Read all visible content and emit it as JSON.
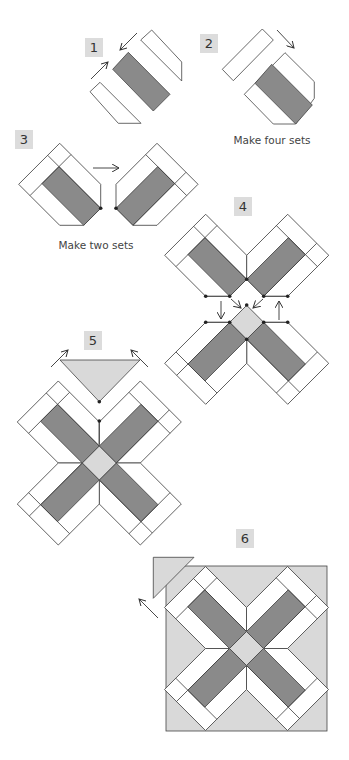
{
  "colors": {
    "dark_fabric": "#8a8a8a",
    "light_fabric": "#d9d9d9",
    "white_fabric": "#ffffff",
    "outline": "#444444",
    "label_bg": "#dcdcdc"
  },
  "steps": [
    {
      "number": "1",
      "label_pos": [
        85,
        38
      ]
    },
    {
      "number": "2",
      "label_pos": [
        200,
        34
      ]
    },
    {
      "number": "3",
      "label_pos": [
        15,
        130
      ]
    },
    {
      "number": "4",
      "label_pos": [
        234,
        197
      ]
    },
    {
      "number": "5",
      "label_pos": [
        84,
        331
      ]
    },
    {
      "number": "6",
      "label_pos": [
        236,
        529
      ]
    }
  ],
  "captions": [
    {
      "text": "Make four sets",
      "pos": [
        272,
        135
      ]
    },
    {
      "text": "Make two sets",
      "pos": [
        96,
        240
      ]
    }
  ],
  "geometry": {
    "arm": {
      "bar_half": 12,
      "side": 29,
      "bar_end": 71,
      "tip": 87
    },
    "step1": {
      "bar": [
        [
          112.7,
          69.3
        ],
        [
          128.3,
          52.3
        ],
        [
          170,
          94.3
        ],
        [
          153.3,
          111
        ]
      ],
      "strip_upper": [
        [
          140.7,
          40
        ],
        [
          151.7,
          30
        ],
        [
          181.7,
          62
        ],
        [
          181.7,
          81
        ]
      ],
      "strip_lower": [
        [
          90,
          91.7
        ],
        [
          100,
          82.3
        ],
        [
          141,
          123.3
        ],
        [
          118.3,
          123.3
        ]
      ],
      "arrows": [
        [
          [
            91,
            79
          ],
          [
            108,
            62
          ]
        ],
        [
          [
            137,
            33
          ],
          [
            120,
            50
          ]
        ]
      ]
    },
    "step2": {
      "strip": [
        [
          222.3,
          69.3
        ],
        [
          262.3,
          29
        ],
        [
          273.3,
          40
        ],
        [
          233.3,
          80.7
        ]
      ],
      "outline": [
        [
          285,
          52.7
        ],
        [
          314.3,
          81.7
        ],
        [
          314.3,
          98.3
        ],
        [
          295.7,
          124
        ],
        [
          273.3,
          124
        ],
        [
          244.3,
          94.3
        ],
        [
          255,
          83.3
        ]
      ],
      "bar": [
        [
          255,
          83.3
        ],
        [
          271.7,
          64.3
        ],
        [
          312.3,
          105
        ],
        [
          295.7,
          124
        ]
      ],
      "inner_line": [
        [
          255,
          83.3
        ],
        [
          273.3,
          124
        ]
      ],
      "arrows": [
        [
          [
            277,
            30
          ],
          [
            294,
            48
          ]
        ]
      ]
    },
    "step3": {
      "units": [
        {
          "center": [
            100.7,
            225.3
          ],
          "rot": 0
        },
        {
          "center": [
            116,
            225.3
          ],
          "rot": 90
        }
      ],
      "dots": [
        [
          100.7,
          208.3
        ],
        [
          116,
          208.3
        ]
      ],
      "arrows": [
        [
          [
            93,
            168
          ],
          [
            119,
            168
          ]
        ]
      ]
    },
    "step4": {
      "upper": {
        "center": [
          246.7,
          296.3
        ],
        "rots": [
          0,
          90
        ]
      },
      "lower": {
        "center": [
          246.7,
          322.3
        ],
        "rots": [
          180,
          270
        ],
        "square": true
      },
      "dots": [
        [
          205.7,
          296.3
        ],
        [
          229.7,
          296.3
        ],
        [
          246.7,
          279.3
        ],
        [
          263.7,
          296.3
        ],
        [
          287.7,
          296.3
        ],
        [
          246.7,
          305
        ],
        [
          205.7,
          322.3
        ],
        [
          229.7,
          322.3
        ],
        [
          263.7,
          322.3
        ],
        [
          287.7,
          322.3
        ],
        [
          246.7,
          339.3
        ]
      ],
      "lines": [
        [
          [
            205.7,
            296.3
          ],
          [
            229.7,
            296.3
          ]
        ],
        [
          [
            263.7,
            296.3
          ],
          [
            287.7,
            296.3
          ]
        ],
        [
          [
            205.7,
            322.3
          ],
          [
            229.7,
            322.3
          ]
        ],
        [
          [
            263.7,
            322.3
          ],
          [
            287.7,
            322.3
          ]
        ]
      ],
      "arrows": [
        [
          [
            221,
            301
          ],
          [
            221,
            319
          ]
        ],
        [
          [
            279,
            320
          ],
          [
            279,
            301
          ]
        ],
        [
          [
            231,
            299
          ],
          [
            241,
            308
          ]
        ],
        [
          [
            263,
            299
          ],
          [
            253,
            308
          ]
        ]
      ]
    },
    "step5": {
      "cross": {
        "center": [
          99.3,
          463
        ],
        "rots": [
          0,
          90,
          180,
          270
        ],
        "square": true
      },
      "triangle": [
        [
          60,
          360
        ],
        [
          140,
          360
        ],
        [
          99.3,
          401.7
        ]
      ],
      "dots": [
        [
          99.3,
          401.7
        ],
        [
          99.3,
          421
        ]
      ],
      "seam": [
        [
          99.3,
          421
        ],
        [
          99.3,
          444
        ]
      ],
      "arrows": [
        [
          [
            51,
            367
          ],
          [
            68,
            350
          ]
        ],
        [
          [
            148,
            367
          ],
          [
            131,
            350
          ]
        ]
      ]
    },
    "step6": {
      "square": [
        166,
        566,
        161,
        165
      ],
      "cross": {
        "center": [
          246.5,
          648.5
        ],
        "rots": [
          0,
          90,
          180,
          270
        ],
        "square": true
      },
      "triangle": [
        [
          153.3,
          557.3
        ],
        [
          194,
          557.3
        ],
        [
          153.3,
          598.3
        ]
      ],
      "arrows": [
        [
          [
            158,
            618
          ],
          [
            139,
            599
          ]
        ]
      ]
    }
  }
}
